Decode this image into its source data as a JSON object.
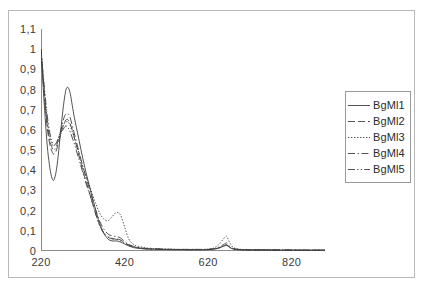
{
  "chart_data": {
    "type": "line",
    "title": "",
    "subtitle": "",
    "xlabel": "",
    "ylabel": "",
    "xlim": [
      220,
      900
    ],
    "ylim": [
      0,
      1.1
    ],
    "grid": false,
    "legend_position": "right",
    "x_ticks": [
      {
        "value": 220,
        "label": "220"
      },
      {
        "value": 420,
        "label": "420"
      },
      {
        "value": 620,
        "label": "620"
      },
      {
        "value": 820,
        "label": "820"
      }
    ],
    "y_ticks": [
      {
        "value": 1.1,
        "label": "1,1"
      },
      {
        "value": 1.0,
        "label": "1"
      },
      {
        "value": 0.9,
        "label": "0,9"
      },
      {
        "value": 0.8,
        "label": "0,8"
      },
      {
        "value": 0.7,
        "label": "0,7"
      },
      {
        "value": 0.6,
        "label": "0,6"
      },
      {
        "value": 0.5,
        "label": "0,5"
      },
      {
        "value": 0.4,
        "label": "0,4"
      },
      {
        "value": 0.3,
        "label": "0,3"
      },
      {
        "value": 0.2,
        "label": "0,2"
      },
      {
        "value": 0.1,
        "label": "0,1"
      },
      {
        "value": 0.0,
        "label": "0"
      }
    ],
    "x": [
      220,
      225,
      230,
      235,
      240,
      245,
      250,
      255,
      260,
      265,
      270,
      275,
      280,
      285,
      290,
      295,
      300,
      310,
      320,
      330,
      340,
      350,
      360,
      370,
      380,
      390,
      400,
      410,
      420,
      430,
      440,
      450,
      470,
      500,
      530,
      560,
      590,
      610,
      630,
      645,
      660,
      665,
      670,
      680,
      700,
      730,
      760,
      800,
      840,
      880,
      900
    ],
    "series": [
      {
        "name": "BgMl1",
        "style": "solid",
        "color": "#404040",
        "values": [
          1.0,
          0.82,
          0.66,
          0.52,
          0.43,
          0.37,
          0.35,
          0.38,
          0.45,
          0.55,
          0.65,
          0.74,
          0.8,
          0.81,
          0.78,
          0.72,
          0.66,
          0.56,
          0.46,
          0.37,
          0.29,
          0.21,
          0.14,
          0.09,
          0.06,
          0.05,
          0.05,
          0.045,
          0.035,
          0.025,
          0.018,
          0.014,
          0.01,
          0.008,
          0.007,
          0.006,
          0.006,
          0.006,
          0.008,
          0.014,
          0.028,
          0.03,
          0.022,
          0.01,
          0.006,
          0.005,
          0.005,
          0.004,
          0.004,
          0.004,
          0.004
        ]
      },
      {
        "name": "BgMl2",
        "style": "dashed",
        "color": "#404040",
        "values": [
          1.0,
          0.85,
          0.72,
          0.61,
          0.54,
          0.5,
          0.48,
          0.49,
          0.52,
          0.56,
          0.6,
          0.63,
          0.65,
          0.65,
          0.63,
          0.6,
          0.56,
          0.48,
          0.4,
          0.33,
          0.26,
          0.19,
          0.13,
          0.09,
          0.07,
          0.06,
          0.06,
          0.055,
          0.042,
          0.03,
          0.022,
          0.017,
          0.012,
          0.009,
          0.008,
          0.007,
          0.007,
          0.007,
          0.009,
          0.015,
          0.027,
          0.029,
          0.021,
          0.011,
          0.007,
          0.006,
          0.005,
          0.005,
          0.004,
          0.004,
          0.004
        ]
      },
      {
        "name": "BgMl3",
        "style": "dotted",
        "color": "#404040",
        "values": [
          1.0,
          0.87,
          0.75,
          0.65,
          0.58,
          0.54,
          0.52,
          0.53,
          0.55,
          0.58,
          0.61,
          0.63,
          0.64,
          0.64,
          0.62,
          0.59,
          0.56,
          0.49,
          0.42,
          0.36,
          0.3,
          0.24,
          0.19,
          0.16,
          0.15,
          0.17,
          0.19,
          0.18,
          0.12,
          0.06,
          0.035,
          0.025,
          0.016,
          0.011,
          0.009,
          0.008,
          0.008,
          0.008,
          0.012,
          0.03,
          0.068,
          0.072,
          0.05,
          0.018,
          0.008,
          0.006,
          0.006,
          0.005,
          0.005,
          0.004,
          0.004
        ]
      },
      {
        "name": "BgMl4",
        "style": "dash-dot",
        "color": "#404040",
        "values": [
          1.0,
          0.86,
          0.73,
          0.63,
          0.56,
          0.52,
          0.5,
          0.51,
          0.54,
          0.58,
          0.62,
          0.66,
          0.68,
          0.68,
          0.66,
          0.62,
          0.58,
          0.5,
          0.42,
          0.35,
          0.28,
          0.21,
          0.15,
          0.11,
          0.085,
          0.075,
          0.072,
          0.065,
          0.048,
          0.033,
          0.024,
          0.018,
          0.013,
          0.01,
          0.008,
          0.008,
          0.008,
          0.008,
          0.01,
          0.018,
          0.036,
          0.039,
          0.027,
          0.012,
          0.007,
          0.006,
          0.005,
          0.005,
          0.004,
          0.004,
          0.004
        ]
      },
      {
        "name": "BgMl5",
        "style": "dash-dot-dot",
        "color": "#404040",
        "values": [
          1.0,
          0.88,
          0.77,
          0.67,
          0.6,
          0.55,
          0.53,
          0.53,
          0.55,
          0.57,
          0.59,
          0.61,
          0.62,
          0.61,
          0.59,
          0.56,
          0.53,
          0.46,
          0.39,
          0.32,
          0.26,
          0.19,
          0.13,
          0.09,
          0.07,
          0.062,
          0.058,
          0.05,
          0.038,
          0.028,
          0.02,
          0.016,
          0.011,
          0.009,
          0.008,
          0.007,
          0.007,
          0.007,
          0.009,
          0.014,
          0.026,
          0.028,
          0.02,
          0.01,
          0.006,
          0.005,
          0.005,
          0.004,
          0.004,
          0.004,
          0.004
        ]
      }
    ]
  },
  "legend": {
    "entries": [
      {
        "label": "BgMl1"
      },
      {
        "label": "BgMl2"
      },
      {
        "label": "BgMl3"
      },
      {
        "label": "BgMl4"
      },
      {
        "label": "BgMl5"
      }
    ]
  },
  "style": {
    "axis_color": "#8a8a8a",
    "line_color": "#404040",
    "frame_color": "#b9b9b9",
    "legend_border": "#9a9a9a",
    "text_color": "#3b3b3b",
    "background": "#ffffff"
  }
}
